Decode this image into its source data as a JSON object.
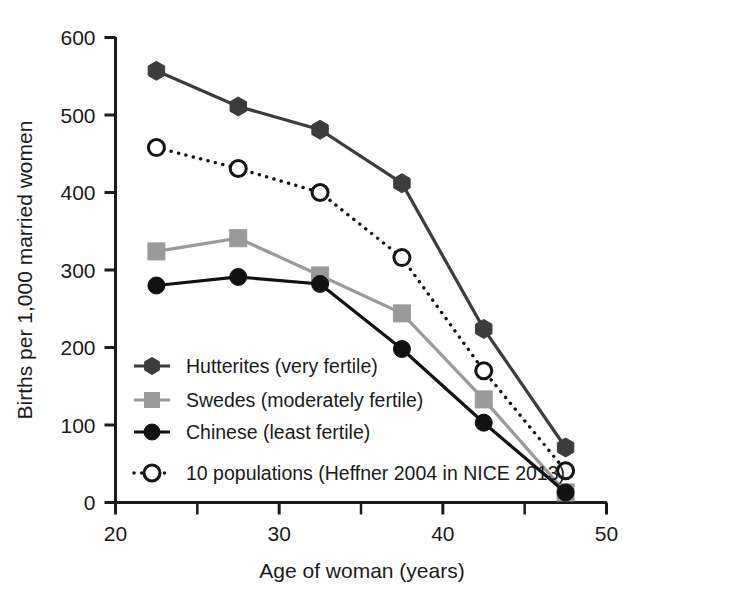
{
  "chart_data": {
    "type": "line",
    "title": "",
    "xlabel": "Age of woman (years)",
    "ylabel": "Births per 1,000 married women",
    "xlim": [
      20,
      50
    ],
    "ylim": [
      0,
      600
    ],
    "xticks": [
      20,
      30,
      40,
      50
    ],
    "xtick_labels": [
      "20",
      "30",
      "40",
      "50"
    ],
    "xminor_ticks": [
      25,
      35,
      45
    ],
    "yticks": [
      0,
      100,
      200,
      300,
      400,
      500,
      600
    ],
    "ytick_labels": [
      "0",
      "100",
      "200",
      "300",
      "400",
      "500",
      "600"
    ],
    "grid": false,
    "legend_position": "lower left inside",
    "x": [
      22.5,
      27.5,
      32.5,
      37.5,
      42.5,
      47.5
    ],
    "series": [
      {
        "name": "Hutterites (very fertile)",
        "values": [
          557,
          511,
          481,
          412,
          224,
          71
        ],
        "color": "#3c3c3c",
        "line_style": "solid",
        "marker": "hexagon",
        "marker_fill": "#3c3c3c"
      },
      {
        "name": "Swedes (moderately fertile)",
        "values": [
          324,
          341,
          293,
          244,
          133,
          13
        ],
        "color": "#9a9a9a",
        "line_style": "solid",
        "marker": "square",
        "marker_fill": "#9a9a9a"
      },
      {
        "name": "Chinese (least fertile)",
        "values": [
          280,
          291,
          282,
          198,
          103,
          13
        ],
        "color": "#111111",
        "line_style": "solid",
        "marker": "circle",
        "marker_fill": "#111111"
      },
      {
        "name": "10 populations (Heffner 2004 in NICE 2013)",
        "values": [
          458,
          431,
          400,
          316,
          170,
          41
        ],
        "color": "#141414",
        "line_style": "dotted",
        "marker": "circle-open",
        "marker_fill": "#ffffff"
      }
    ]
  },
  "legend": {
    "entries": [
      {
        "label": "Hutterites (very fertile)"
      },
      {
        "label": "Swedes (moderately fertile)"
      },
      {
        "label": "Chinese (least fertile)"
      },
      {
        "label": "10 populations (Heffner 2004 in NICE 2013)"
      }
    ]
  },
  "colors": {
    "hutterites": "#3c3c3c",
    "swedes": "#9a9a9a",
    "chinese": "#111111",
    "ten_populations": "#141414",
    "axis": "#1a1a1a",
    "background": "#ffffff"
  }
}
